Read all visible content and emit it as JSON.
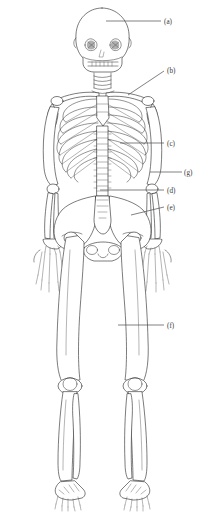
{
  "figure": {
    "background_color": "#ffffff",
    "line_color": "#2b2b2b",
    "label_color": "#3a3a3a",
    "view": "anterior",
    "label_count": 7
  },
  "labels": [
    {
      "key": "a",
      "text": "(a)",
      "part": "skull",
      "text_x": 164,
      "text_y": 24,
      "line_x1": 106,
      "line_y1": 21,
      "line_x2": 161,
      "line_y2": 21
    },
    {
      "key": "b",
      "text": "(b)",
      "part": "clavicle",
      "text_x": 167,
      "text_y": 73,
      "line_x1": 128,
      "line_y1": 95,
      "line_x2": 164,
      "line_y2": 71
    },
    {
      "key": "c",
      "text": "(c)",
      "part": "ribs",
      "text_x": 167,
      "text_y": 146,
      "line_x1": 120,
      "line_y1": 143,
      "line_x2": 164,
      "line_y2": 143
    },
    {
      "key": "g",
      "text": "(g)",
      "part": "humerus-radius-ulna",
      "text_x": 184,
      "text_y": 175,
      "line_x1": 150,
      "line_y1": 172,
      "line_x2": 182,
      "line_y2": 172
    },
    {
      "key": "d",
      "text": "(d)",
      "part": "lumbar-vertebrae",
      "text_x": 167,
      "text_y": 193,
      "line_x1": 100,
      "line_y1": 190,
      "line_x2": 164,
      "line_y2": 190
    },
    {
      "key": "e",
      "text": "(e)",
      "part": "pelvis",
      "text_x": 167,
      "text_y": 210,
      "line_x1": 131,
      "line_y1": 215,
      "line_x2": 164,
      "line_y2": 207
    },
    {
      "key": "f",
      "text": "(f)",
      "part": "femur",
      "text_x": 167,
      "text_y": 328,
      "line_x1": 118,
      "line_y1": 325,
      "line_x2": 164,
      "line_y2": 325
    }
  ]
}
